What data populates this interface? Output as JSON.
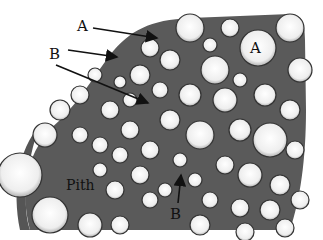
{
  "figure": {
    "labels": {
      "a_top": "A",
      "a_cell": "A",
      "b_left": "B",
      "b_bottom": "B",
      "pith": "Pith"
    },
    "colors": {
      "background": "#ffffff",
      "cell_wall": "#2a2a2a",
      "cell_fill": "#f4f4f4",
      "arrow": "#111111"
    }
  }
}
